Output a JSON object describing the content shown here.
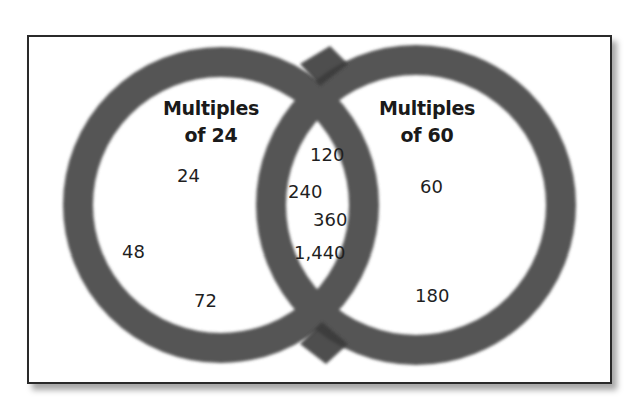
{
  "diagram": {
    "type": "venn",
    "colors": {
      "ring": "#555555",
      "ring_overlap": "#3a3a3a",
      "frame_border": "#2a2a2a",
      "background": "#ffffff",
      "text": "#1a1a1a"
    },
    "sets": [
      {
        "id": "left",
        "title_line1": "Multiples",
        "title_line2": "of 24",
        "only_values": [
          "24",
          "48",
          "72"
        ]
      },
      {
        "id": "right",
        "title_line1": "Multiples",
        "title_line2": "of 60",
        "only_values": [
          "60",
          "180"
        ]
      }
    ],
    "intersection": {
      "values": [
        "120",
        "240",
        "360",
        "1,440"
      ]
    }
  }
}
